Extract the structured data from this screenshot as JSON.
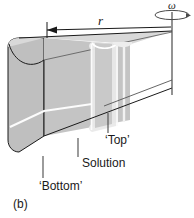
{
  "figure": {
    "panel_label": "(b)",
    "radius_label": "r",
    "angular_velocity_label": "ω",
    "annotations": {
      "top": "‘Top’",
      "solution": "Solution",
      "bottom": "‘Bottom’"
    },
    "icons": {
      "rotation_axis": "rotation-axis-icon",
      "spin_ellipse": "angular-velocity-ellipse-icon",
      "radius_arrow": "radius-dimension-arrow-icon"
    },
    "colors": {
      "outline": "#1a1a1a",
      "body_front": "#bfbfbf",
      "body_side": "#b0b0b0",
      "body_top": "#d9d9d9",
      "cell_light": "#efefef",
      "cell_mid": "#cfcfcf",
      "highlight_line": "#ffffff",
      "background": "#ffffff",
      "leader_line": "#4a4a4a"
    }
  }
}
